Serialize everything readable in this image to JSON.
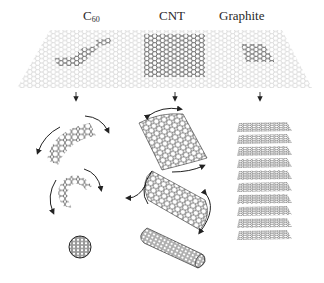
{
  "figure": {
    "labels": {
      "c60_main": "C",
      "c60_sub": "60",
      "cnt": "CNT",
      "graphite": "Graphite"
    },
    "graphene_sheet": {
      "top_left": [
        50,
        30
      ],
      "top_right": [
        282,
        30
      ],
      "bottom_left": [
        17,
        88
      ],
      "bottom_right": [
        312,
        88
      ],
      "highlight_regions": [
        "C60 fragment",
        "CNT rectangle",
        "Graphite patch"
      ]
    },
    "columns": [
      {
        "name": "C60",
        "arrow_x": 76,
        "steps": [
          "curved graphene fragment",
          "partially closed cage",
          "closed C60 buckyball"
        ]
      },
      {
        "name": "CNT",
        "arrow_x": 175,
        "steps": [
          "curved graphene sheet",
          "half-rolled tube",
          "closed nanotube"
        ]
      },
      {
        "name": "Graphite",
        "arrow_x": 260,
        "steps": [
          "stacked graphene layers"
        ],
        "layer_count": 10
      }
    ],
    "colors": {
      "ink": "#2a2a2a",
      "sheet": "#b8b8b8",
      "background": "#ffffff"
    }
  }
}
